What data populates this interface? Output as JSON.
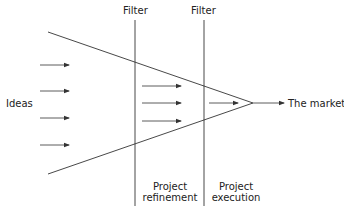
{
  "diagram": {
    "type": "innovation-funnel",
    "labels": {
      "filter_1": "Filter",
      "filter_2": "Filter",
      "input": "Ideas",
      "output": "The market",
      "stage_1_line1": "Project",
      "stage_1_line2": "refinement",
      "stage_2_line1": "Project",
      "stage_2_line2": "execution"
    },
    "stages": [
      {
        "name": "Ideas",
        "arrow_count": 4
      },
      {
        "name": "Project refinement",
        "arrow_count": 3
      },
      {
        "name": "Project execution",
        "arrow_count": 1
      }
    ],
    "colors": {
      "line": "#333333",
      "text": "#222222",
      "background": "#ffffff"
    }
  }
}
